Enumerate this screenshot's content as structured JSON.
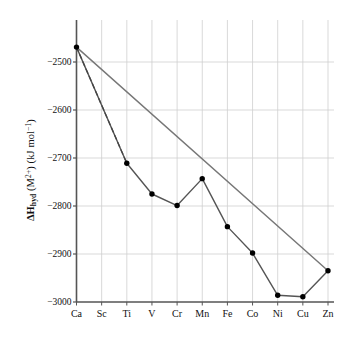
{
  "chart_data": {
    "type": "line",
    "title": "",
    "xlabel": "",
    "ylabel": "ΔH_hyd (M2+) (kJ mol-1)",
    "ylabel_parts": {
      "delta": "ΔH",
      "sub": "hyd",
      "open": " (M",
      "sup": "2+",
      "mid": ") (kJ mol",
      "sup2": "−1",
      "close": ")"
    },
    "categories": [
      "Ca",
      "Sc",
      "Ti",
      "V",
      "Cr",
      "Mn",
      "Fe",
      "Co",
      "Ni",
      "Cu",
      "Zn"
    ],
    "ylim": [
      -3000,
      -2440
    ],
    "yticks": [
      -2500,
      -2600,
      -2700,
      -2800,
      -2900,
      -3000
    ],
    "ytick_labels": [
      "−2500",
      "−2600",
      "−2700",
      "−2800",
      "−2900",
      "−3000"
    ],
    "grid": true,
    "legend": "none",
    "series": [
      {
        "name": "Experimental hydration enthalpy",
        "style": "solid-with-markers",
        "color": "#555555",
        "marker_color": "#000000",
        "points": [
          {
            "x": "Ca",
            "y": -2469
          },
          {
            "x": "Ti",
            "y": -2711
          },
          {
            "x": "V",
            "y": -2775
          },
          {
            "x": "Cr",
            "y": -2799
          },
          {
            "x": "Mn",
            "y": -2743
          },
          {
            "x": "Fe",
            "y": -2843
          },
          {
            "x": "Co",
            "y": -2898
          },
          {
            "x": "Ni",
            "y": -2986
          },
          {
            "x": "Cu",
            "y": -2989
          },
          {
            "x": "Zn",
            "y": -2935
          }
        ]
      },
      {
        "name": "Reference straight line Ca to Zn",
        "style": "solid",
        "color": "#777777",
        "points": [
          {
            "x": "Ca",
            "y": -2469
          },
          {
            "x": "Zn",
            "y": -2935
          }
        ]
      },
      {
        "name": "Dashed extrapolation Ca to Ti",
        "style": "dashed",
        "color": "#444444",
        "points": [
          {
            "x": "Ca",
            "y": -2469
          },
          {
            "x": "Ti",
            "y": -2711
          }
        ]
      }
    ]
  },
  "axes": {
    "y_axis_name": "y-axis",
    "x_axis_name": "x-axis"
  }
}
